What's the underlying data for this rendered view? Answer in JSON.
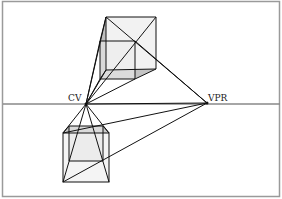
{
  "diagram": {
    "labels": {
      "cv": "CV",
      "vpr": "VPR"
    },
    "points": {
      "cv": [
        86,
        104
      ],
      "vpr": [
        207,
        103
      ]
    },
    "colors": {
      "line": "#111111",
      "horizon": "#888888",
      "face_light": "#f0f0f0",
      "face_shade": "#bdbdbd",
      "frame": "#9a9a9a"
    }
  }
}
